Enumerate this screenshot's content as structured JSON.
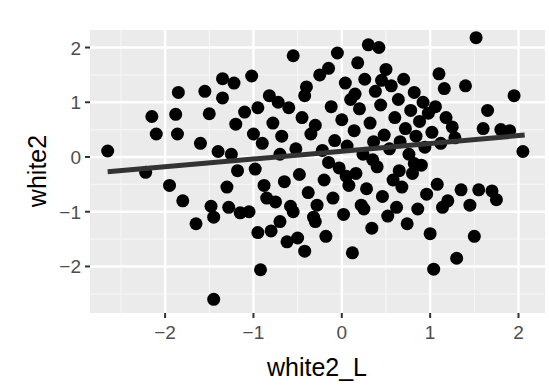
{
  "chart_data": {
    "type": "scatter",
    "title": "",
    "xlabel": "white2_L",
    "ylabel": "white2",
    "xlim": [
      -2.85,
      2.3
    ],
    "ylim": [
      -2.85,
      2.32
    ],
    "x_ticks": [
      -2,
      -1,
      0,
      1,
      2
    ],
    "y_ticks": [
      -2,
      -1,
      0,
      1,
      2
    ],
    "x_tick_labels": [
      "−2",
      "−1",
      "0",
      "1",
      "2"
    ],
    "y_tick_labels": [
      "−2",
      "−1",
      "0",
      "1",
      "2"
    ],
    "grid": true,
    "legend": null,
    "theme": {
      "panel_background": "#ebebeb",
      "grid_major": "#ffffff",
      "grid_minor": "#f5f5f5",
      "point_color": "#000000",
      "line_color": "#333333"
    },
    "regression_line": {
      "x": [
        -2.65,
        2.07
      ],
      "y": [
        -0.27,
        0.4
      ],
      "method": "lm"
    },
    "series": [
      {
        "name": "white2 vs white2_L",
        "points": [
          [
            -2.65,
            0.11
          ],
          [
            -2.15,
            0.74
          ],
          [
            -2.1,
            0.42
          ],
          [
            -2.22,
            -0.28
          ],
          [
            -1.95,
            -0.52
          ],
          [
            -1.88,
            0.78
          ],
          [
            -1.85,
            1.18
          ],
          [
            -1.86,
            0.42
          ],
          [
            -1.8,
            -0.8
          ],
          [
            -1.65,
            -1.22
          ],
          [
            -1.55,
            1.2
          ],
          [
            -1.5,
            0.79
          ],
          [
            -1.48,
            -0.9
          ],
          [
            -1.45,
            -1.1
          ],
          [
            -1.4,
            0.1
          ],
          [
            -1.35,
            1.43
          ],
          [
            -1.3,
            -0.55
          ],
          [
            -1.28,
            -0.92
          ],
          [
            -1.25,
            0.05
          ],
          [
            -1.22,
            1.35
          ],
          [
            -1.2,
            0.6
          ],
          [
            -1.18,
            -0.25
          ],
          [
            -1.15,
            -1.02
          ],
          [
            -1.1,
            0.82
          ],
          [
            -1.05,
            -1.0
          ],
          [
            -1.02,
            1.48
          ],
          [
            -1.0,
            0.42
          ],
          [
            -0.98,
            -0.22
          ],
          [
            -0.95,
            -1.38
          ],
          [
            -0.92,
            -2.06
          ],
          [
            -0.9,
            0.25
          ],
          [
            -0.88,
            -0.52
          ],
          [
            -0.85,
            -0.75
          ],
          [
            -0.82,
            1.12
          ],
          [
            -0.8,
            -1.35
          ],
          [
            -0.78,
            0.62
          ],
          [
            -0.75,
            -0.82
          ],
          [
            -0.72,
            1.0
          ],
          [
            -0.7,
            -1.18
          ],
          [
            -0.68,
            0.38
          ],
          [
            -0.65,
            -0.45
          ],
          [
            -0.62,
            -1.55
          ],
          [
            -0.6,
            0.9
          ],
          [
            -0.58,
            -0.9
          ],
          [
            -0.55,
            1.85
          ],
          [
            -0.52,
            0.15
          ],
          [
            -0.5,
            -1.48
          ],
          [
            -0.48,
            -0.32
          ],
          [
            -0.45,
            0.72
          ],
          [
            -0.42,
            -1.72
          ],
          [
            -0.4,
            1.28
          ],
          [
            -0.38,
            -0.65
          ],
          [
            -0.35,
            0.42
          ],
          [
            -0.32,
            -1.1
          ],
          [
            -0.3,
            0.58
          ],
          [
            -0.28,
            -0.88
          ],
          [
            -0.25,
            1.5
          ],
          [
            -0.22,
            0.12
          ],
          [
            -0.2,
            -0.42
          ],
          [
            -0.18,
            -1.45
          ],
          [
            -0.15,
            1.62
          ],
          [
            -0.12,
            0.92
          ],
          [
            -0.1,
            -0.75
          ],
          [
            -0.08,
            0.3
          ],
          [
            -0.05,
            1.9
          ],
          [
            -0.03,
            -0.2
          ],
          [
            0.0,
            0.68
          ],
          [
            0.02,
            -1.05
          ],
          [
            0.04,
            1.35
          ],
          [
            0.06,
            0.2
          ],
          [
            0.08,
            -0.52
          ],
          [
            0.1,
            1.05
          ],
          [
            0.12,
            -1.75
          ],
          [
            0.14,
            0.48
          ],
          [
            0.16,
            -0.3
          ],
          [
            0.18,
            1.72
          ],
          [
            0.2,
            0.88
          ],
          [
            0.22,
            -0.88
          ],
          [
            0.24,
            0.05
          ],
          [
            0.26,
            1.42
          ],
          [
            0.28,
            -0.58
          ],
          [
            0.3,
            2.05
          ],
          [
            0.32,
            0.62
          ],
          [
            0.34,
            -1.3
          ],
          [
            0.36,
            0.28
          ],
          [
            0.38,
            1.2
          ],
          [
            0.4,
            -0.18
          ],
          [
            0.42,
            2.0
          ],
          [
            0.44,
            0.95
          ],
          [
            0.46,
            -0.72
          ],
          [
            0.48,
            0.4
          ],
          [
            0.5,
            1.6
          ],
          [
            0.52,
            -1.08
          ],
          [
            0.54,
            0.15
          ],
          [
            0.56,
            1.3
          ],
          [
            0.58,
            -0.42
          ],
          [
            0.6,
            0.72
          ],
          [
            0.62,
            -0.92
          ],
          [
            0.64,
            1.05
          ],
          [
            0.66,
            0.28
          ],
          [
            0.68,
            -0.55
          ],
          [
            0.7,
            1.42
          ],
          [
            0.72,
            0.52
          ],
          [
            0.74,
            -1.22
          ],
          [
            0.76,
            0.05
          ],
          [
            0.78,
            0.85
          ],
          [
            0.8,
            -0.3
          ],
          [
            0.82,
            1.18
          ],
          [
            0.84,
            0.38
          ],
          [
            0.86,
            -0.95
          ],
          [
            0.88,
            0.65
          ],
          [
            0.9,
            -0.15
          ],
          [
            0.92,
            1.0
          ],
          [
            0.94,
            0.18
          ],
          [
            0.96,
            -0.68
          ],
          [
            0.98,
            0.8
          ],
          [
            1.0,
            -1.4
          ],
          [
            1.02,
            0.45
          ],
          [
            1.04,
            -2.05
          ],
          [
            1.06,
            0.92
          ],
          [
            1.08,
            -0.5
          ],
          [
            1.1,
            1.52
          ],
          [
            1.12,
            0.25
          ],
          [
            1.14,
            -0.92
          ],
          [
            1.16,
            1.25
          ],
          [
            1.2,
            -0.8
          ],
          [
            1.25,
            0.55
          ],
          [
            1.3,
            -1.85
          ],
          [
            1.35,
            -0.6
          ],
          [
            1.4,
            1.3
          ],
          [
            1.45,
            -0.88
          ],
          [
            1.5,
            -1.45
          ],
          [
            1.52,
            2.18
          ],
          [
            1.55,
            -0.6
          ],
          [
            1.6,
            0.52
          ],
          [
            1.65,
            0.85
          ],
          [
            1.7,
            -0.62
          ],
          [
            1.75,
            -0.78
          ],
          [
            1.8,
            0.5
          ],
          [
            1.9,
            0.48
          ],
          [
            1.95,
            1.12
          ],
          [
            2.05,
            0.1
          ],
          [
            -1.45,
            -2.6
          ],
          [
            -0.55,
            -1.0
          ],
          [
            -0.3,
            -1.18
          ],
          [
            0.25,
            -0.95
          ],
          [
            -0.15,
            -0.1
          ],
          [
            0.05,
            -0.35
          ],
          [
            0.35,
            -0.05
          ],
          [
            0.65,
            -0.25
          ],
          [
            -0.7,
            0.05
          ],
          [
            -0.95,
            0.9
          ],
          [
            -1.6,
            0.25
          ],
          [
            -1.35,
            1.08
          ],
          [
            0.15,
            1.15
          ],
          [
            0.45,
            1.4
          ],
          [
            -0.42,
            1.12
          ],
          [
            1.18,
            0.72
          ],
          [
            1.28,
            0.35
          ],
          [
            0.82,
            -0.12
          ]
        ]
      }
    ]
  }
}
